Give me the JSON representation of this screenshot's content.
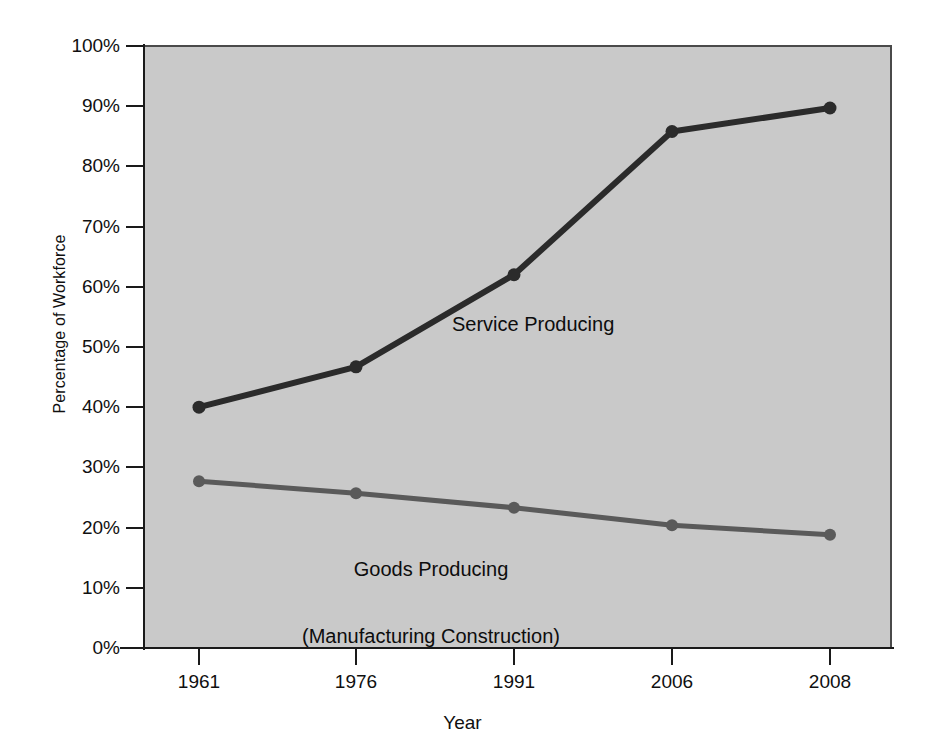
{
  "chart_data": {
    "type": "line",
    "title": "",
    "xlabel": "Year",
    "ylabel": "Percentage of Workforce",
    "categories": [
      "1961",
      "1976",
      "1991",
      "2006",
      "2008"
    ],
    "x": [
      1961,
      1976,
      1991,
      2006,
      2008
    ],
    "xlim": [
      0,
      4
    ],
    "ylim": [
      0,
      100
    ],
    "yticks": [
      0,
      10,
      20,
      30,
      40,
      50,
      60,
      70,
      80,
      90,
      100
    ],
    "ytick_labels": [
      "0%",
      "10%",
      "20%",
      "30%",
      "40%",
      "50%",
      "60%",
      "70%",
      "80%",
      "90%",
      "100%"
    ],
    "grid": false,
    "legend": "inline-annotation",
    "plot_background": "#c9c9c9",
    "series": [
      {
        "name": "Service Producing",
        "color": "#2b2b2b",
        "annotation": "Service Producing",
        "values": [
          40.0,
          46.7,
          62.0,
          85.8,
          89.7
        ]
      },
      {
        "name": "Goods Producing (Manufacturing Construction)",
        "color": "#5a5a5a",
        "annotation_line1": "Goods Producing",
        "annotation_line2": "(Manufacturing Construction)",
        "values": [
          27.7,
          25.7,
          23.3,
          20.4,
          18.8
        ]
      }
    ]
  },
  "figure": {
    "axis_color": "#1a1a1a",
    "text_color": "#101010",
    "page_background": "#ffffff"
  }
}
